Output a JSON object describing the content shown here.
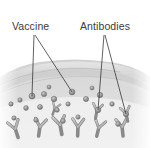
{
  "figure": {
    "type": "biology-illustration",
    "background_color": "#ffffff",
    "style": "grayscale-shaded-drawing",
    "width": 150,
    "height": 148
  },
  "labels": [
    {
      "id": "vaccine",
      "text": "Vaccine",
      "x": 12,
      "y": 30,
      "color": "#3b3b3b",
      "leaders": [
        {
          "from_x": 34,
          "from_y": 35,
          "to_x": 32,
          "to_y": 96
        },
        {
          "from_x": 35,
          "from_y": 35,
          "to_x": 72,
          "to_y": 92
        }
      ]
    },
    {
      "id": "antibodies",
      "text": "Antibodies",
      "x": 80,
      "y": 30,
      "color": "#3b3b3b",
      "leaders": [
        {
          "from_x": 104,
          "from_y": 35,
          "to_x": 98,
          "to_y": 110
        },
        {
          "from_x": 105,
          "from_y": 35,
          "to_x": 126,
          "to_y": 114
        }
      ]
    }
  ],
  "tissue": {
    "surface_band_color": "#d4d4d4",
    "upper_layer_color": "#c9c9c9",
    "body_color": "#dcdcdc",
    "deep_color": "#efefef",
    "top_y": 62,
    "bottom_y": 148
  },
  "vaccine_particles": [
    {
      "x": 32,
      "y": 96,
      "r": 3.0
    },
    {
      "x": 44,
      "y": 94,
      "r": 2.6
    },
    {
      "x": 54,
      "y": 99,
      "r": 2.8
    },
    {
      "x": 72,
      "y": 92,
      "r": 2.9
    },
    {
      "x": 20,
      "y": 100,
      "r": 2.2
    },
    {
      "x": 11,
      "y": 104,
      "r": 2.2
    },
    {
      "x": 26,
      "y": 108,
      "r": 2.4
    },
    {
      "x": 40,
      "y": 107,
      "r": 2.5
    },
    {
      "x": 57,
      "y": 110,
      "r": 2.3
    },
    {
      "x": 68,
      "y": 104,
      "r": 2.2
    },
    {
      "x": 86,
      "y": 99,
      "r": 2.6
    },
    {
      "x": 100,
      "y": 95,
      "r": 2.7
    },
    {
      "x": 98,
      "y": 110,
      "r": 2.8
    },
    {
      "x": 112,
      "y": 104,
      "r": 2.3
    },
    {
      "x": 126,
      "y": 114,
      "r": 2.7
    },
    {
      "x": 118,
      "y": 124,
      "r": 2.4
    },
    {
      "x": 63,
      "y": 121,
      "r": 2.4
    },
    {
      "x": 78,
      "y": 117,
      "r": 2.2
    },
    {
      "x": 36,
      "y": 120,
      "r": 2.3
    },
    {
      "x": 14,
      "y": 118,
      "r": 2.2
    },
    {
      "x": 49,
      "y": 87,
      "r": 2.0
    },
    {
      "x": 92,
      "y": 88,
      "r": 2.0
    }
  ],
  "antibodies": [
    {
      "x": 15,
      "y": 128,
      "angle": -18,
      "scale": 1.0
    },
    {
      "x": 40,
      "y": 126,
      "angle": 8,
      "scale": 1.0
    },
    {
      "x": 60,
      "y": 124,
      "angle": -10,
      "scale": 1.05
    },
    {
      "x": 78,
      "y": 126,
      "angle": 2,
      "scale": 1.0
    },
    {
      "x": 99,
      "y": 127,
      "angle": 14,
      "scale": 0.95
    },
    {
      "x": 122,
      "y": 126,
      "angle": -6,
      "scale": 1.0
    },
    {
      "x": 97,
      "y": 110,
      "angle": 10,
      "scale": 0.85
    },
    {
      "x": 126,
      "y": 113,
      "angle": -12,
      "scale": 0.85
    },
    {
      "x": 55,
      "y": 108,
      "angle": 20,
      "scale": 0.7
    }
  ],
  "colors": {
    "label_text": "#3b3b3b",
    "leader_stroke": "#2e2e2e",
    "particle_fill": "#8d8d8d",
    "particle_stroke": "#6b6b6b",
    "antibody_fill": "#b4b4b4",
    "antibody_stroke": "#8a8a8a"
  }
}
